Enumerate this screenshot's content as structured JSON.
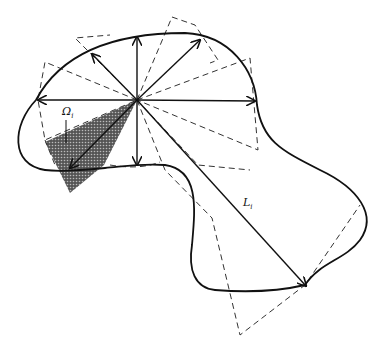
{
  "figure": {
    "type": "geometric diagram",
    "labels": {
      "omega": "Ω",
      "omega_sub": "i",
      "length": "L",
      "length_sub": "i"
    },
    "center": [
      137,
      100
    ],
    "colors": {
      "stroke": "#111111",
      "dash": "#333333",
      "shade": "#3a3a3a",
      "background": "#ffffff"
    },
    "caption": ""
  }
}
